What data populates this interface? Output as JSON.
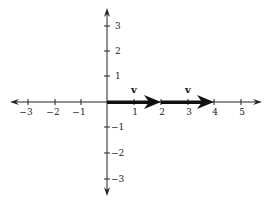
{
  "diagram": {
    "type": "coordinate-plane-vectors",
    "x_axis": {
      "ticks": [
        "−3",
        "−2",
        "−1",
        "1",
        "2",
        "3",
        "4",
        "5"
      ],
      "values": [
        -3,
        -2,
        -1,
        1,
        2,
        3,
        4,
        5
      ]
    },
    "y_axis": {
      "ticks": [
        "3",
        "2",
        "1",
        "−1",
        "−2",
        "−3"
      ],
      "values": [
        3,
        2,
        1,
        -1,
        -2,
        -3
      ]
    },
    "vectors": [
      {
        "label": "v",
        "from": [
          0,
          0
        ],
        "to": [
          2,
          0
        ]
      },
      {
        "label": "v",
        "from": [
          2,
          0
        ],
        "to": [
          4,
          0
        ]
      }
    ],
    "colors": {
      "axis": "#222222",
      "vector": "#111111",
      "background": "#ffffff"
    }
  }
}
